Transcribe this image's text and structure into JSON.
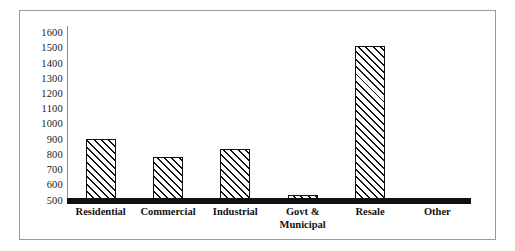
{
  "chart_data": {
    "type": "bar",
    "title": "",
    "subtitle": "",
    "xlabel": "",
    "ylabel": "",
    "categories": [
      "Residential",
      "Commercial",
      "Industrial",
      "Govt &\nMunicipal",
      "Resale",
      "Other"
    ],
    "values": [
      905,
      790,
      840,
      540,
      1520,
      500
    ],
    "ylim": [
      500,
      1650
    ],
    "yticks": [
      500,
      600,
      700,
      800,
      900,
      1000,
      1100,
      1200,
      1300,
      1400,
      1500,
      1600
    ],
    "ytick_labels": [
      "500",
      "600",
      "700",
      "800",
      "900",
      "1000",
      "1100",
      "1200",
      "1300",
      "1400",
      "1500",
      "1600"
    ],
    "grid": false,
    "legend": null,
    "legend_position": "none",
    "bar_fill": "diagonal-hatch",
    "bar_edge_color": "#111111",
    "axis_color": "#111111",
    "frame_color": "#9a9a9a",
    "background": "#ffffff"
  }
}
